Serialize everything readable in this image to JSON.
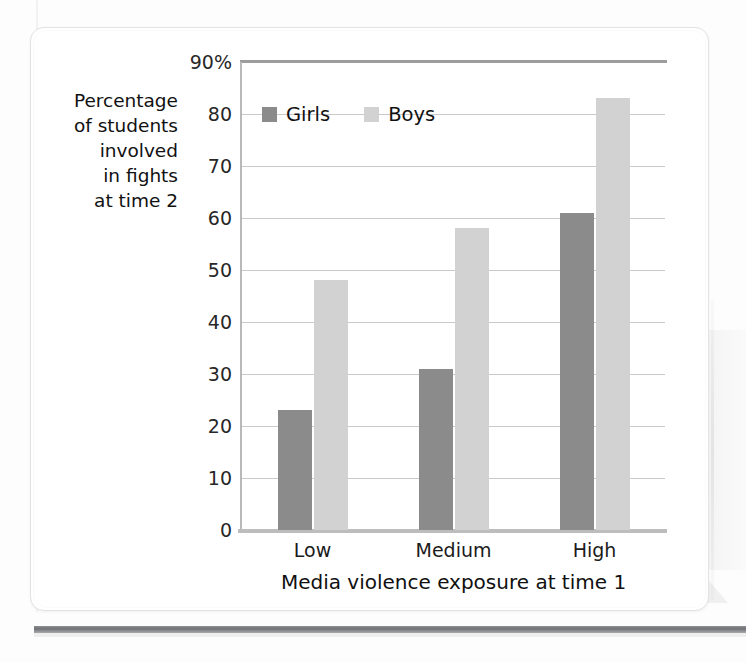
{
  "chart_data": {
    "type": "bar",
    "title": "",
    "categories": [
      "Low",
      "Medium",
      "High"
    ],
    "series": [
      {
        "name": "Girls",
        "values": [
          23,
          31,
          61
        ],
        "color": "#8b8b8b"
      },
      {
        "name": "Boys",
        "values": [
          48,
          58,
          83
        ],
        "color": "#d2d2d2"
      }
    ],
    "xlabel": "Media violence exposure at time 1",
    "ylabel": "Percentage of students involved in fights at time 2",
    "ylabel_lines": [
      "Percentage",
      "of students",
      "involved",
      "in fights",
      "at time 2"
    ],
    "ylim": [
      0,
      90
    ],
    "yticks": [
      0,
      10,
      20,
      30,
      40,
      50,
      60,
      70,
      80,
      90
    ],
    "ytick_labels": [
      "0",
      "10",
      "20",
      "30",
      "40",
      "50",
      "60",
      "70",
      "80",
      "90%"
    ],
    "grid": true,
    "legend_position": "top-left-inside"
  },
  "legend": {
    "items": [
      {
        "label": "Girls",
        "color": "#8b8b8b"
      },
      {
        "label": "Boys",
        "color": "#d2d2d2"
      }
    ]
  },
  "axis": {
    "x_title": "Media violence exposure at time 1",
    "x_categories": [
      "Low",
      "Medium",
      "High"
    ],
    "y_label_lines": [
      "Percentage",
      "of students",
      "involved",
      "in fights",
      "at time 2"
    ],
    "y_ticks": [
      "90%",
      "80",
      "70",
      "60",
      "50",
      "40",
      "30",
      "20",
      "10",
      "0"
    ]
  },
  "colors": {
    "girls": "#8b8b8b",
    "boys": "#d2d2d2",
    "gridline": "#c9c9c9",
    "axis": "#b9b9b9",
    "text": "#111111",
    "bottom_rule": "#6f7174"
  }
}
